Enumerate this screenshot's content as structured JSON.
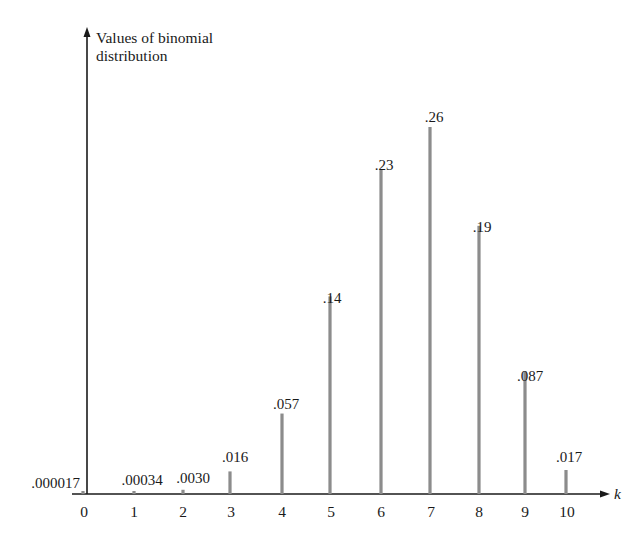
{
  "chart_data": {
    "type": "bar",
    "title": "",
    "ylabel": "Values of binomial distribution",
    "ylabel_lines": [
      "Values of binomial",
      "distribution"
    ],
    "xlabel": "k",
    "categories": [
      "0",
      "1",
      "2",
      "3",
      "4",
      "5",
      "6",
      "7",
      "8",
      "9",
      "10"
    ],
    "values": [
      1.7e-05,
      0.00034,
      0.003,
      0.016,
      0.057,
      0.14,
      0.23,
      0.26,
      0.19,
      0.087,
      0.017
    ],
    "value_labels": [
      ".000017",
      ".00034",
      ".0030",
      ".016",
      ".057",
      ".14",
      ".23",
      ".26",
      ".19",
      ".087",
      ".017"
    ],
    "ylim": [
      0,
      0.3
    ],
    "grid": false,
    "legend": null,
    "bar_style": "thin vertical lines (stem plot)"
  },
  "colors": {
    "axis": "#1a1a1a",
    "bar": "#8c8c8c",
    "text": "#1a1a1a",
    "background": "#ffffff"
  }
}
